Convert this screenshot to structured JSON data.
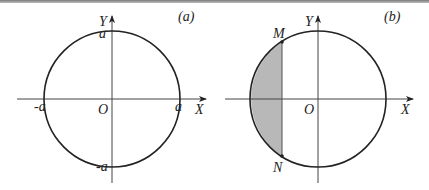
{
  "figure": {
    "panels": [
      {
        "id": "a",
        "tag": "(a)",
        "axis_x": "X",
        "axis_y": "Y",
        "origin": "O",
        "labels": {
          "top": "a",
          "bottom": "-a",
          "left": "-a",
          "right": "a"
        }
      },
      {
        "id": "b",
        "tag": "(b)",
        "axis_x": "X",
        "axis_y": "Y",
        "origin": "O",
        "points": {
          "upper": "M",
          "lower": "N"
        },
        "shaded_region": "circular segment left of chord MN"
      }
    ],
    "colors": {
      "line": "#222222",
      "axis": "#444444",
      "shade": "#b8b8b8"
    }
  }
}
